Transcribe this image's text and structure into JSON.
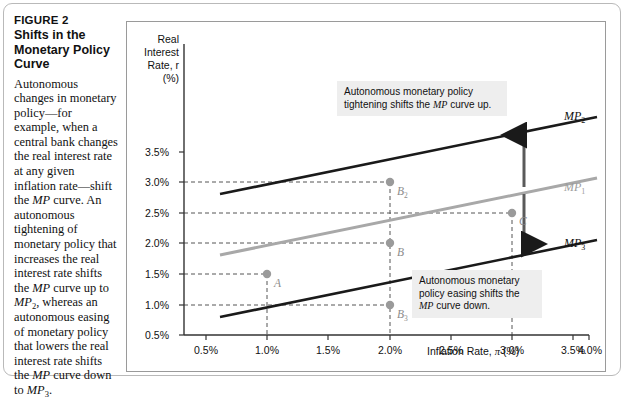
{
  "figure": {
    "number": "FIGURE 2",
    "title": "Shifts in the Monetary Policy Curve",
    "caption": "Autonomous changes in monetary policy—for example, when a central bank changes the real interest rate at any given inflation rate—shift the MP curve. An autonomous tightening of monetary policy that increases the real interest rate shifts the MP curve up to MP2, whereas an autonomous easing of monetary policy that lowers the real interest rate shifts the MP curve down to MP3."
  },
  "axes": {
    "ylabel_line1": "Real",
    "ylabel_line2": "Interest",
    "ylabel_line3": "Rate, r",
    "ylabel_line4": "(%)",
    "xlabel_text": "Inflation Rate, ",
    "xlabel_symbol": "π",
    "xlabel_unit": " (%)",
    "yticks": [
      "0.5%",
      "1.0%",
      "1.5%",
      "2.0%",
      "2.5%",
      "3.0%",
      "3.5%"
    ],
    "xticks": [
      "0.5%",
      "1.0%",
      "1.5%",
      "2.0%",
      "2.5%",
      "3.0%",
      "3.5%",
      "4.0%"
    ]
  },
  "callouts": {
    "top_line1": "Autonomous monetary policy",
    "top_line2_a": "tightening shifts the ",
    "top_line2_mp": "MP",
    "top_line2_b": " curve up.",
    "bottom_line1": "Autonomous monetary",
    "bottom_line2": "policy easing shifts the",
    "bottom_line3_mp": "MP",
    "bottom_line3_b": " curve down."
  },
  "curve_labels": {
    "mp2": "MP",
    "mp2_sub": "2",
    "mp1": "MP",
    "mp1_sub": "1",
    "mp3": "MP",
    "mp3_sub": "3"
  },
  "point_labels": {
    "a": "A",
    "b": "B",
    "b2": "B",
    "b2_sub": "2",
    "b3": "B",
    "b3_sub": "3",
    "c": "C"
  },
  "colors": {
    "mp_black": "#1a1a1a",
    "mp_gray": "#a8a8a8",
    "point_gray": "#9a9a9a",
    "dash_gray": "#555555",
    "callout_bg": "#eeeeee",
    "panel_border": "#9a9a9a"
  },
  "chart_data": {
    "type": "line",
    "title": "Shifts in the Monetary Policy Curve",
    "xlabel": "Inflation Rate, π (%)",
    "ylabel": "Real Interest Rate, r (%)",
    "xlim": [
      0.25,
      4.25
    ],
    "ylim": [
      0.0,
      3.75
    ],
    "grid": false,
    "legend": "inline curve labels at right",
    "series": [
      {
        "name": "MP2",
        "color": "#1a1a1a",
        "label": "MP2",
        "description": "Monetary policy curve after autonomous tightening",
        "x": [
          0.75,
          4.0
        ],
        "y": [
          2.2,
          3.45
        ]
      },
      {
        "name": "MP1",
        "color": "#a8a8a8",
        "label": "MP1",
        "description": "Original monetary policy curve",
        "x": [
          0.75,
          4.0
        ],
        "y": [
          1.2,
          2.45
        ]
      },
      {
        "name": "MP3",
        "color": "#1a1a1a",
        "label": "MP3",
        "description": "Monetary policy curve after autonomous easing",
        "x": [
          0.75,
          4.0
        ],
        "y": [
          0.2,
          1.45
        ]
      }
    ],
    "points": [
      {
        "label": "A",
        "x": 1.0,
        "y": 1.5,
        "curve": "MP1"
      },
      {
        "label": "B",
        "x": 2.0,
        "y": 2.0,
        "curve": "MP1"
      },
      {
        "label": "C",
        "x": 3.0,
        "y": 2.5,
        "curve": "MP1"
      },
      {
        "label": "B2",
        "x": 2.0,
        "y": 3.0,
        "curve": "MP2"
      },
      {
        "label": "B3",
        "x": 2.0,
        "y": 1.0,
        "curve": "MP3"
      }
    ],
    "annotations": [
      {
        "text": "Autonomous monetary policy tightening shifts the MP curve up.",
        "position": "upper-center"
      },
      {
        "text": "Autonomous monetary policy easing shifts the MP curve down.",
        "position": "lower-right"
      },
      {
        "text": "up-arrow from MP1 to MP2",
        "position": "right"
      },
      {
        "text": "down-arrow from MP1 to MP3",
        "position": "right"
      }
    ]
  }
}
